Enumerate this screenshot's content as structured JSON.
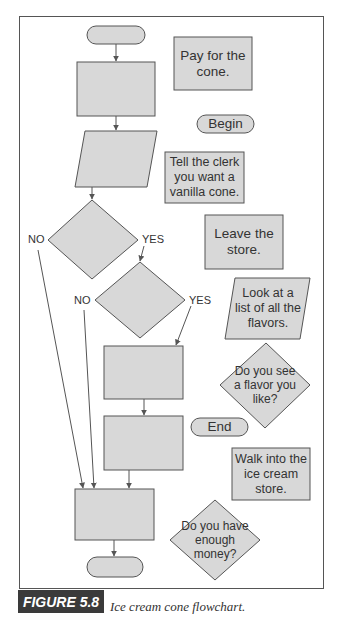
{
  "figure": {
    "label": "FIGURE 5.8",
    "caption": "Ice cream cone flowchart."
  },
  "colors": {
    "shape_fill": "#d8d8d8",
    "shape_stroke": "#555555",
    "figure_label_bg": "#3a3a3a"
  },
  "flowchart_template": {
    "branch_labels": {
      "d1_no": "NO",
      "d1_yes": "YES",
      "d2_no": "NO",
      "d2_yes": "YES"
    }
  },
  "answer_shapes": {
    "pay": "Pay for the cone.",
    "begin": "Begin",
    "tell": "Tell the clerk you want a vanilla cone.",
    "leave": "Leave the store.",
    "look": "Look at a list of all the flavors.",
    "see_flavor": "Do you see a flavor you like?",
    "end": "End",
    "walk": "Walk into the ice cream store.",
    "money": "Do you have enough money?"
  }
}
